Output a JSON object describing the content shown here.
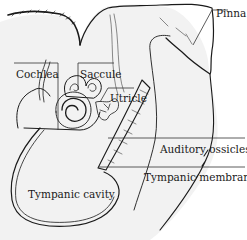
{
  "diagram": {
    "labels": {
      "pinna": "Pinna",
      "cochlea": "Cochlea",
      "saccule": "Saccule",
      "utricle": "Utricle",
      "auditory_ossicles": "Auditory ossicles",
      "tympanic_membrane": "Tympanic membrane",
      "tympanic_cavity": "Tympanic cavity"
    },
    "colors": {
      "background": "#ffffff",
      "fill": "#f2f2f2",
      "ink": "#1a1a1a"
    }
  }
}
